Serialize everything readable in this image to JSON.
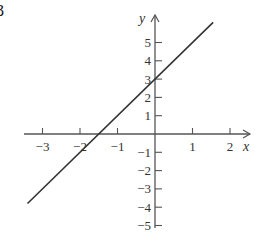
{
  "figure_label": "3",
  "chart_data": {
    "type": "line",
    "title": "",
    "xlabel": "x",
    "ylabel": "y",
    "x_ticks": [
      -3,
      -2,
      -1,
      1,
      2
    ],
    "y_ticks": [
      5,
      4,
      3,
      2,
      1,
      -1,
      -2,
      -3,
      -4,
      -5
    ],
    "xlim": [
      -3.5,
      2.5
    ],
    "ylim": [
      -6,
      6
    ],
    "grid": false,
    "legend": null,
    "series": [
      {
        "name": "y = 2x + 3",
        "equation": "y = 2x + 3",
        "x": [
          -3.4,
          1.55
        ],
        "y": [
          -3.8,
          6.1
        ],
        "y_intercept": 3,
        "x_intercept": -1.5,
        "slope": 2
      }
    ]
  },
  "style": {
    "axis_color": "#555555",
    "line_color": "#333333"
  }
}
